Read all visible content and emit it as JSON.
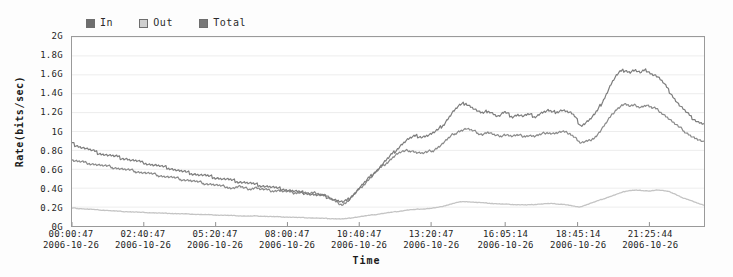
{
  "chart_data": {
    "type": "line",
    "title": "",
    "xlabel": "Time",
    "ylabel": "Rate(bits/sec)",
    "ylim": [
      0,
      2000000000
    ],
    "y_unit": "G",
    "y_ticks": [
      "0G",
      "0.2G",
      "0.4G",
      "0.6G",
      "0.8G",
      "1G",
      "1.2G",
      "1.4G",
      "1.6G",
      "1.8G",
      "2G"
    ],
    "y_tick_values": [
      0,
      0.2,
      0.4,
      0.6,
      0.8,
      1.0,
      1.2,
      1.4,
      1.6,
      1.8,
      2.0
    ],
    "grid": true,
    "legend_position": "top-left",
    "x_tick_times": [
      "00:00:47",
      "02:40:47",
      "05:20:47",
      "08:00:47",
      "10:40:47",
      "13:20:47",
      "16:05:14",
      "18:45:14",
      "21:25:44"
    ],
    "x_tick_dates": [
      "2006-10-26",
      "2006-10-26",
      "2006-10-26",
      "2006-10-26",
      "2006-10-26",
      "2006-10-26",
      "2006-10-26",
      "2006-10-26",
      "2006-10-26"
    ],
    "x_tick_fractions": [
      0.0,
      0.1136,
      0.2273,
      0.3409,
      0.4545,
      0.5682,
      0.6854,
      0.8,
      0.9136
    ],
    "series": [
      {
        "name": "Total",
        "color": "#7d7d7d",
        "values": [
          0.88,
          0.86,
          0.85,
          0.84,
          0.83,
          0.82,
          0.81,
          0.8,
          0.79,
          0.78,
          0.77,
          0.765,
          0.76,
          0.75,
          0.745,
          0.74,
          0.735,
          0.73,
          0.72,
          0.715,
          0.71,
          0.7,
          0.695,
          0.69,
          0.685,
          0.675,
          0.67,
          0.665,
          0.655,
          0.65,
          0.645,
          0.64,
          0.635,
          0.625,
          0.62,
          0.615,
          0.61,
          0.6,
          0.595,
          0.585,
          0.58,
          0.575,
          0.565,
          0.56,
          0.555,
          0.55,
          0.545,
          0.54,
          0.535,
          0.53,
          0.525,
          0.52,
          0.515,
          0.51,
          0.505,
          0.5,
          0.495,
          0.49,
          0.485,
          0.48,
          0.475,
          0.47,
          0.465,
          0.46,
          0.455,
          0.45,
          0.445,
          0.44,
          0.435,
          0.43,
          0.425,
          0.42,
          0.415,
          0.41,
          0.405,
          0.4,
          0.395,
          0.39,
          0.385,
          0.38,
          0.375,
          0.37,
          0.365,
          0.36,
          0.355,
          0.35,
          0.345,
          0.34,
          0.335,
          0.33,
          0.325,
          0.32,
          0.315,
          0.31,
          0.3,
          0.29,
          0.28,
          0.27,
          0.26,
          0.25,
          0.26,
          0.28,
          0.31,
          0.34,
          0.37,
          0.4,
          0.43,
          0.46,
          0.49,
          0.52,
          0.55,
          0.58,
          0.61,
          0.64,
          0.67,
          0.7,
          0.73,
          0.76,
          0.79,
          0.82,
          0.85,
          0.875,
          0.9,
          0.92,
          0.935,
          0.945,
          0.955,
          0.95,
          0.945,
          0.95,
          0.96,
          0.97,
          0.985,
          1.0,
          1.02,
          1.05,
          1.08,
          1.12,
          1.16,
          1.2,
          1.23,
          1.26,
          1.28,
          1.29,
          1.3,
          1.28,
          1.26,
          1.24,
          1.22,
          1.2,
          1.19,
          1.2,
          1.22,
          1.21,
          1.19,
          1.17,
          1.16,
          1.18,
          1.2,
          1.19,
          1.17,
          1.16,
          1.17,
          1.18,
          1.17,
          1.16,
          1.17,
          1.18,
          1.17,
          1.16,
          1.17,
          1.19,
          1.2,
          1.21,
          1.22,
          1.21,
          1.2,
          1.21,
          1.22,
          1.23,
          1.22,
          1.21,
          1.2,
          1.18,
          1.15,
          1.1,
          1.06,
          1.08,
          1.1,
          1.12,
          1.15,
          1.18,
          1.22,
          1.27,
          1.32,
          1.38,
          1.44,
          1.5,
          1.55,
          1.59,
          1.62,
          1.64,
          1.65,
          1.64,
          1.63,
          1.645,
          1.65,
          1.63,
          1.62,
          1.64,
          1.65,
          1.63,
          1.61,
          1.6,
          1.58,
          1.55,
          1.52,
          1.48,
          1.44,
          1.4,
          1.36,
          1.32,
          1.28,
          1.25,
          1.22,
          1.19,
          1.16,
          1.14,
          1.12,
          1.1,
          1.09,
          1.08
        ]
      },
      {
        "name": "In",
        "color": "#8a8a8a",
        "values": [
          0.7,
          0.69,
          0.685,
          0.68,
          0.675,
          0.67,
          0.665,
          0.66,
          0.655,
          0.65,
          0.645,
          0.64,
          0.635,
          0.63,
          0.625,
          0.62,
          0.615,
          0.61,
          0.605,
          0.6,
          0.595,
          0.59,
          0.585,
          0.58,
          0.575,
          0.57,
          0.565,
          0.56,
          0.555,
          0.55,
          0.545,
          0.54,
          0.535,
          0.53,
          0.525,
          0.52,
          0.515,
          0.51,
          0.505,
          0.5,
          0.495,
          0.49,
          0.485,
          0.48,
          0.475,
          0.47,
          0.465,
          0.46,
          0.455,
          0.45,
          0.445,
          0.44,
          0.435,
          0.43,
          0.425,
          0.42,
          0.415,
          0.41,
          0.405,
          0.4,
          0.41,
          0.42,
          0.41,
          0.4,
          0.395,
          0.39,
          0.4,
          0.41,
          0.4,
          0.39,
          0.385,
          0.38,
          0.375,
          0.37,
          0.375,
          0.38,
          0.375,
          0.37,
          0.365,
          0.36,
          0.355,
          0.35,
          0.355,
          0.36,
          0.355,
          0.35,
          0.345,
          0.34,
          0.345,
          0.35,
          0.345,
          0.34,
          0.335,
          0.32,
          0.3,
          0.28,
          0.26,
          0.245,
          0.235,
          0.23,
          0.245,
          0.27,
          0.3,
          0.33,
          0.36,
          0.39,
          0.42,
          0.45,
          0.48,
          0.51,
          0.54,
          0.57,
          0.595,
          0.62,
          0.645,
          0.67,
          0.695,
          0.72,
          0.745,
          0.765,
          0.78,
          0.785,
          0.79,
          0.795,
          0.8,
          0.79,
          0.78,
          0.775,
          0.77,
          0.775,
          0.78,
          0.79,
          0.8,
          0.82,
          0.84,
          0.86,
          0.885,
          0.91,
          0.935,
          0.96,
          0.98,
          1.0,
          1.01,
          1.02,
          1.03,
          1.02,
          1.01,
          1.0,
          0.99,
          0.98,
          0.97,
          0.98,
          0.99,
          0.98,
          0.965,
          0.955,
          0.95,
          0.96,
          0.97,
          0.965,
          0.955,
          0.95,
          0.955,
          0.96,
          0.955,
          0.95,
          0.955,
          0.96,
          0.955,
          0.95,
          0.955,
          0.965,
          0.975,
          0.985,
          0.99,
          0.985,
          0.98,
          0.985,
          0.99,
          0.995,
          0.99,
          0.985,
          0.98,
          0.96,
          0.94,
          0.9,
          0.88,
          0.885,
          0.89,
          0.9,
          0.92,
          0.94,
          0.97,
          1.0,
          1.04,
          1.08,
          1.12,
          1.16,
          1.2,
          1.24,
          1.26,
          1.28,
          1.29,
          1.28,
          1.265,
          1.27,
          1.28,
          1.265,
          1.26,
          1.27,
          1.28,
          1.265,
          1.25,
          1.245,
          1.23,
          1.21,
          1.19,
          1.165,
          1.14,
          1.115,
          1.09,
          1.065,
          1.04,
          1.02,
          1.0,
          0.98,
          0.96,
          0.94,
          0.925,
          0.91,
          0.895,
          0.88
        ]
      },
      {
        "name": "Out",
        "color": "#c4c4c4",
        "values": [
          0.19,
          0.188,
          0.186,
          0.184,
          0.182,
          0.18,
          0.178,
          0.176,
          0.174,
          0.172,
          0.17,
          0.168,
          0.166,
          0.164,
          0.162,
          0.16,
          0.158,
          0.156,
          0.155,
          0.153,
          0.152,
          0.15,
          0.149,
          0.148,
          0.146,
          0.145,
          0.144,
          0.142,
          0.141,
          0.14,
          0.139,
          0.138,
          0.137,
          0.136,
          0.135,
          0.134,
          0.133,
          0.132,
          0.131,
          0.13,
          0.129,
          0.128,
          0.127,
          0.126,
          0.125,
          0.124,
          0.123,
          0.122,
          0.121,
          0.12,
          0.119,
          0.118,
          0.117,
          0.116,
          0.115,
          0.114,
          0.113,
          0.112,
          0.111,
          0.11,
          0.109,
          0.108,
          0.107,
          0.106,
          0.105,
          0.104,
          0.105,
          0.106,
          0.105,
          0.104,
          0.103,
          0.102,
          0.101,
          0.1,
          0.099,
          0.098,
          0.097,
          0.096,
          0.095,
          0.094,
          0.093,
          0.092,
          0.091,
          0.09,
          0.089,
          0.088,
          0.087,
          0.086,
          0.085,
          0.084,
          0.083,
          0.082,
          0.081,
          0.08,
          0.079,
          0.078,
          0.077,
          0.076,
          0.075,
          0.075,
          0.078,
          0.082,
          0.086,
          0.09,
          0.094,
          0.098,
          0.102,
          0.106,
          0.11,
          0.114,
          0.118,
          0.122,
          0.126,
          0.13,
          0.134,
          0.138,
          0.142,
          0.146,
          0.15,
          0.154,
          0.158,
          0.162,
          0.166,
          0.17,
          0.172,
          0.174,
          0.176,
          0.178,
          0.18,
          0.182,
          0.184,
          0.186,
          0.19,
          0.194,
          0.198,
          0.205,
          0.212,
          0.22,
          0.228,
          0.236,
          0.244,
          0.25,
          0.254,
          0.256,
          0.258,
          0.256,
          0.254,
          0.252,
          0.25,
          0.248,
          0.246,
          0.244,
          0.242,
          0.24,
          0.238,
          0.236,
          0.234,
          0.232,
          0.231,
          0.23,
          0.229,
          0.228,
          0.227,
          0.226,
          0.225,
          0.224,
          0.223,
          0.224,
          0.226,
          0.228,
          0.23,
          0.232,
          0.234,
          0.236,
          0.238,
          0.237,
          0.236,
          0.234,
          0.232,
          0.23,
          0.228,
          0.224,
          0.218,
          0.212,
          0.206,
          0.2,
          0.205,
          0.215,
          0.225,
          0.235,
          0.245,
          0.255,
          0.265,
          0.275,
          0.285,
          0.295,
          0.305,
          0.315,
          0.325,
          0.335,
          0.345,
          0.355,
          0.365,
          0.372,
          0.376,
          0.378,
          0.38,
          0.378,
          0.375,
          0.372,
          0.37,
          0.372,
          0.375,
          0.378,
          0.38,
          0.378,
          0.375,
          0.37,
          0.365,
          0.355,
          0.345,
          0.33,
          0.315,
          0.3,
          0.29,
          0.28,
          0.27,
          0.26,
          0.25,
          0.24,
          0.23,
          0.22
        ]
      }
    ]
  },
  "legend": {
    "items": [
      {
        "label": "In",
        "color": "#6e6e6e"
      },
      {
        "label": "Out",
        "color": "#cfcfcf"
      },
      {
        "label": "Total",
        "color": "#787878"
      }
    ]
  },
  "axes": {
    "y_title": "Rate(bits/sec)",
    "x_title": "Time"
  }
}
